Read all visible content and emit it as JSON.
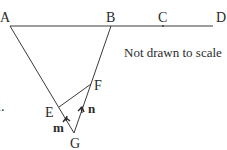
{
  "diagram": {
    "note": "Not drawn to scale",
    "question_fragment": "l.",
    "points": {
      "A": {
        "label": "A",
        "x": 10,
        "y": 26
      },
      "B": {
        "label": "B",
        "x": 111,
        "y": 26
      },
      "C": {
        "label": "C",
        "x": 163,
        "y": 26
      },
      "D": {
        "label": "D",
        "x": 213,
        "y": 26
      },
      "E": {
        "label": "E",
        "x": 59,
        "y": 107
      },
      "F": {
        "label": "F",
        "x": 91,
        "y": 84
      },
      "G": {
        "label": "G",
        "x": 74,
        "y": 133
      }
    },
    "vectors": {
      "m": {
        "label": "m",
        "from": "G",
        "to": "E"
      },
      "n": {
        "label": "n",
        "from": "G",
        "to": "F"
      }
    },
    "colors": {
      "line": "#3a3a3a",
      "text": "#2a2a2a",
      "background": "#ffffff"
    }
  }
}
